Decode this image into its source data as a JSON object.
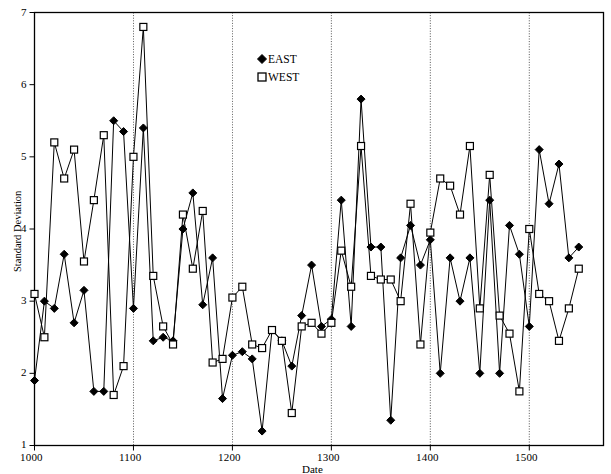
{
  "chart_data": {
    "type": "line",
    "title": "",
    "subtitle": "",
    "xlabel": "Date",
    "ylabel": "Standard Deviation",
    "xlim": [
      1000,
      1575
    ],
    "ylim": [
      1,
      7
    ],
    "xticks": [
      1000,
      1100,
      1200,
      1300,
      1400,
      1500
    ],
    "xtick_labels": [
      "1000",
      "1100",
      "1200",
      "1300",
      "1400",
      "1500"
    ],
    "yticks": [
      1,
      2,
      3,
      4,
      5,
      6,
      7
    ],
    "ytick_labels": [
      "1",
      "2",
      "3",
      "4",
      "5",
      "6",
      "7"
    ],
    "grid": false,
    "vertical_rules_at": [
      1100,
      1200,
      1300,
      1400,
      1500
    ],
    "legend_position": "top-center-right",
    "markers": {
      "EAST": "filled-diamond",
      "WEST": "open-square"
    },
    "colors": {
      "EAST": "#000000",
      "WEST": "#000000",
      "axis": "#000000",
      "background": "#ffffff"
    },
    "series": [
      {
        "name": "EAST",
        "marker": "filled-diamond",
        "x": [
          1000,
          1010,
          1020,
          1030,
          1040,
          1050,
          1060,
          1070,
          1080,
          1090,
          1100,
          1110,
          1120,
          1130,
          1140,
          1150,
          1160,
          1170,
          1180,
          1190,
          1200,
          1210,
          1220,
          1230,
          1240,
          1250,
          1260,
          1270,
          1280,
          1290,
          1300,
          1310,
          1320,
          1330,
          1340,
          1350,
          1360,
          1370,
          1380,
          1390,
          1400,
          1410,
          1420,
          1430,
          1440,
          1450,
          1460,
          1470,
          1480,
          1490,
          1500,
          1510,
          1520,
          1530,
          1540,
          1550
        ],
        "values": [
          1.9,
          3.0,
          2.9,
          3.65,
          2.7,
          3.15,
          1.75,
          1.75,
          5.5,
          5.35,
          2.9,
          5.4,
          2.45,
          2.5,
          2.45,
          4.0,
          4.5,
          2.95,
          3.6,
          1.65,
          2.25,
          2.3,
          2.2,
          1.2,
          2.6,
          2.45,
          2.1,
          2.8,
          3.5,
          2.65,
          2.75,
          4.4,
          2.65,
          5.8,
          3.75,
          3.75,
          1.35,
          3.6,
          4.05,
          3.5,
          3.85,
          2.0,
          3.6,
          3.0,
          3.6,
          2.0,
          4.4,
          2.0,
          4.05,
          3.65,
          2.65,
          5.1,
          4.35,
          4.9,
          3.6,
          3.75
        ]
      },
      {
        "name": "WEST",
        "marker": "open-square",
        "x": [
          1000,
          1010,
          1020,
          1030,
          1040,
          1050,
          1060,
          1070,
          1080,
          1090,
          1100,
          1110,
          1120,
          1130,
          1140,
          1150,
          1160,
          1170,
          1180,
          1190,
          1200,
          1210,
          1220,
          1230,
          1240,
          1250,
          1260,
          1270,
          1280,
          1290,
          1300,
          1310,
          1320,
          1330,
          1340,
          1350,
          1360,
          1370,
          1380,
          1390,
          1400,
          1410,
          1420,
          1430,
          1440,
          1450,
          1460,
          1470,
          1480,
          1490,
          1500,
          1510,
          1520,
          1530,
          1540,
          1550
        ],
        "values": [
          3.1,
          2.5,
          5.2,
          4.7,
          5.1,
          3.55,
          4.4,
          5.3,
          1.7,
          2.1,
          5.0,
          6.8,
          3.35,
          2.65,
          2.4,
          4.2,
          3.45,
          4.25,
          2.15,
          2.2,
          3.05,
          3.2,
          2.4,
          2.35,
          2.6,
          2.45,
          1.45,
          2.65,
          2.7,
          2.55,
          2.7,
          3.7,
          3.2,
          5.15,
          3.35,
          3.3,
          3.3,
          3.0,
          4.35,
          2.4,
          3.95,
          4.7,
          4.6,
          4.2,
          5.15,
          2.9,
          4.75,
          2.8,
          2.55,
          1.75,
          4.0,
          3.1,
          3.0,
          2.45,
          2.9,
          3.45
        ]
      }
    ]
  },
  "legend": {
    "entries": [
      {
        "label": "EAST",
        "marker": "filled-diamond"
      },
      {
        "label": "WEST",
        "marker": "open-square"
      }
    ]
  },
  "axes": {
    "y_title": "Standard Deviation",
    "x_title": "Date",
    "y_labels": [
      "7",
      "6",
      "5",
      "4",
      "3",
      "2",
      "1"
    ],
    "x_labels": [
      "1000",
      "1100",
      "1200",
      "1300",
      "1400",
      "1500"
    ]
  }
}
